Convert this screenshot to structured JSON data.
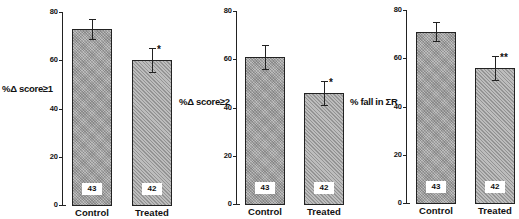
{
  "chart_data": [
    {
      "type": "bar",
      "title": "",
      "ylabel": "%Δ score≥1",
      "xlabel": "",
      "ylim": [
        0,
        80
      ],
      "yticks": [
        0,
        20,
        40,
        60,
        80
      ],
      "categories": [
        "Control",
        "Treated"
      ],
      "values": [
        73,
        60
      ],
      "error": [
        [
          69,
          77
        ],
        [
          55,
          65
        ]
      ],
      "n": [
        43,
        42
      ],
      "significance": [
        "",
        "*"
      ],
      "grid": false
    },
    {
      "type": "bar",
      "title": "",
      "ylabel": "%Δ score≥2",
      "xlabel": "",
      "ylim": [
        0,
        80
      ],
      "yticks": [
        0,
        20,
        40,
        60,
        80
      ],
      "categories": [
        "Control",
        "Treated"
      ],
      "values": [
        61,
        46
      ],
      "error": [
        [
          56,
          66
        ],
        [
          41,
          51
        ]
      ],
      "n": [
        43,
        42
      ],
      "significance": [
        "",
        "*"
      ],
      "grid": false
    },
    {
      "type": "bar",
      "title": "",
      "ylabel": "% fall in ΣR",
      "xlabel": "",
      "ylim": [
        0,
        80
      ],
      "yticks": [
        0,
        20,
        40,
        60,
        80
      ],
      "categories": [
        "Control",
        "Treated"
      ],
      "values": [
        71,
        56
      ],
      "error": [
        [
          67,
          75
        ],
        [
          51,
          61
        ]
      ],
      "n": [
        43,
        42
      ],
      "significance": [
        "",
        "**"
      ],
      "grid": false
    }
  ],
  "panels": [
    {
      "ylabel": "%Δ score≥1",
      "ticks": [
        "0",
        "20",
        "40",
        "60",
        "80"
      ],
      "control": {
        "label": "Control",
        "n": "43",
        "sig": ""
      },
      "treated": {
        "label": "Treated",
        "n": "42",
        "sig": "*"
      }
    },
    {
      "ylabel": "%Δ score≥2",
      "ticks": [
        "0",
        "20",
        "40",
        "60",
        "80"
      ],
      "control": {
        "label": "Control",
        "n": "43",
        "sig": ""
      },
      "treated": {
        "label": "Treated",
        "n": "42",
        "sig": "*"
      }
    },
    {
      "ylabel": "% fall in ΣR",
      "ticks": [
        "0",
        "20",
        "40",
        "60",
        "80"
      ],
      "control": {
        "label": "Control",
        "n": "43",
        "sig": ""
      },
      "treated": {
        "label": "Treated",
        "n": "42",
        "sig": "**"
      }
    }
  ]
}
